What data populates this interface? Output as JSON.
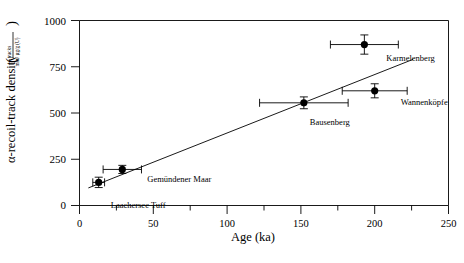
{
  "chart_data": {
    "type": "scatter",
    "title": "",
    "xlabel": "Age (ka)",
    "ylabel": "α-recoil-track density",
    "ylabel_units_numerator": "tracks",
    "ylabel_units_denominator": "mm² µg/g (U)",
    "xlim": [
      0,
      250
    ],
    "ylim": [
      0,
      1000
    ],
    "xticks": [
      0,
      50,
      100,
      150,
      200,
      250
    ],
    "xticklabels": [
      "0",
      "50",
      "100",
      "150",
      "200",
      "250"
    ],
    "xminorticks": [
      25,
      75,
      125,
      175,
      225
    ],
    "yticks": [
      0,
      250,
      500,
      750,
      1000
    ],
    "yticklabels": [
      "0",
      "250",
      "500",
      "750",
      "1000"
    ],
    "grid": false,
    "legend": "none",
    "marker": "filled-circle",
    "points": [
      {
        "label": "Laachersee Tuff",
        "x": 13,
        "y": 125,
        "xerr": 4,
        "yerr": 28,
        "label_dx": 12,
        "label_dy": 26,
        "label_anchor": "start"
      },
      {
        "label": "Gemündener Maar",
        "x": 29,
        "y": 195,
        "xerr": 13,
        "yerr": 22,
        "label_dx": 25,
        "label_dy": 13,
        "label_anchor": "start"
      },
      {
        "label": "Bausenberg",
        "x": 152,
        "y": 555,
        "xerr": 30,
        "yerr": 32,
        "label_dx": 6,
        "label_dy": 22,
        "label_anchor": "start"
      },
      {
        "label": "Wannenköpfe",
        "x": 200,
        "y": 620,
        "xerr": 22,
        "yerr": 38,
        "label_dx": 26,
        "label_dy": 14,
        "label_anchor": "start"
      },
      {
        "label": "Karmelenberg",
        "x": 193,
        "y": 870,
        "xerr": 23,
        "yerr": 52,
        "label_dx": 22,
        "label_dy": 16,
        "label_anchor": "start"
      }
    ],
    "fit_line": {
      "x0": 6,
      "y0": 95,
      "x1": 226,
      "y1": 790
    }
  }
}
